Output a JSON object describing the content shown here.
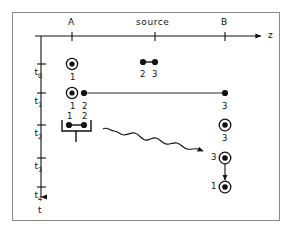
{
  "figure": {
    "kind": "spacetime-diagram",
    "background_color": "#ffffff",
    "ink_color": "#111111",
    "frame_color": "#8a8a8a"
  },
  "axes": {
    "horizontal": {
      "name": "z",
      "label": "z",
      "ticks": [
        {
          "id": "A",
          "label": "A",
          "x": 72
        },
        {
          "id": "source",
          "label": "source",
          "x": 155
        },
        {
          "id": "B",
          "label": "B",
          "x": 225
        }
      ]
    },
    "vertical": {
      "name": "t",
      "label": "t",
      "ticks": [
        {
          "id": "t0",
          "label": "t",
          "sub": "0",
          "y": 64
        },
        {
          "id": "t1",
          "label": "t",
          "sub": "1",
          "y": 93
        },
        {
          "id": "t2",
          "label": "t",
          "sub": "2",
          "y": 125
        },
        {
          "id": "t3",
          "label": "t",
          "sub": "3",
          "y": 158
        },
        {
          "id": "t4",
          "label": "t",
          "sub": "4",
          "y": 187
        }
      ]
    }
  },
  "rows": [
    {
      "time": "t0",
      "particles": [
        {
          "id": "1",
          "label": "1",
          "style": "ringed",
          "x": 72,
          "label_pos": "below"
        },
        {
          "id": "2",
          "label": "2",
          "style": "plain",
          "x": 143,
          "label_pos": "below"
        },
        {
          "id": "3",
          "label": "3",
          "style": "plain",
          "x": 155,
          "label_pos": "below"
        }
      ],
      "pair_bond": {
        "from": 143,
        "to": 155
      }
    },
    {
      "time": "t1",
      "particles": [
        {
          "id": "1",
          "label": "1",
          "style": "ringed",
          "x": 72,
          "label_pos": "below"
        },
        {
          "id": "2",
          "label": "2",
          "style": "plain",
          "x": 84,
          "label_pos": "below"
        },
        {
          "id": "3",
          "label": "3",
          "style": "plain",
          "x": 225,
          "label_pos": "below"
        }
      ],
      "connector": {
        "from": 84,
        "to": 225
      }
    },
    {
      "time": "t2",
      "particles": [
        {
          "id": "1",
          "label": "1",
          "style": "plain",
          "x": 69,
          "label_pos": "above"
        },
        {
          "id": "2",
          "label": "2",
          "style": "plain",
          "x": 84,
          "label_pos": "above"
        },
        {
          "id": "3",
          "label": "3",
          "style": "ringed",
          "x": 225,
          "label_pos": "below"
        }
      ],
      "measurement_bracket": {
        "from": 62,
        "to": 91,
        "stem_x": 76
      }
    },
    {
      "time": "t3",
      "particles": [
        {
          "id": "3",
          "label": "3",
          "style": "ringed",
          "x": 225,
          "label_pos": "left"
        }
      ]
    },
    {
      "time": "t4",
      "particles": [
        {
          "id": "1",
          "label": "1",
          "style": "ringed",
          "x": 225,
          "label_pos": "left"
        }
      ]
    }
  ],
  "annotations": {
    "wavy_signal_arrow": {
      "name": "wavy-signal-arrow",
      "from": {
        "x": 103,
        "y": 130
      },
      "to": {
        "x": 206,
        "y": 152
      }
    },
    "vertical_transition_arrow": {
      "name": "vertical-transition-arrow",
      "from": {
        "x": 225,
        "y": 163
      },
      "to": {
        "x": 225,
        "y": 182
      }
    }
  }
}
